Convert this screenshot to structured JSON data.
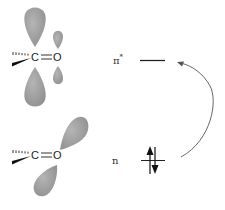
{
  "diagram": {
    "type": "molecular-orbital-transition",
    "colors": {
      "lobe": "#9a9a9a",
      "lobe_light": "#b8b8b8",
      "line": "#222222",
      "arrow": "#555555"
    },
    "upper_structure": {
      "carbon": "C",
      "oxygen": "O",
      "bond": "=",
      "orbital": "pi-star"
    },
    "lower_structure": {
      "carbon": "C",
      "oxygen": "O",
      "bond": "=",
      "orbital": "n"
    },
    "levels": [
      {
        "label": "π",
        "superscript": "*",
        "name": "pi-star",
        "electrons": 0
      },
      {
        "label": "n",
        "superscript": "",
        "name": "nonbonding",
        "electrons": 2
      }
    ],
    "transition": "n → π*"
  }
}
